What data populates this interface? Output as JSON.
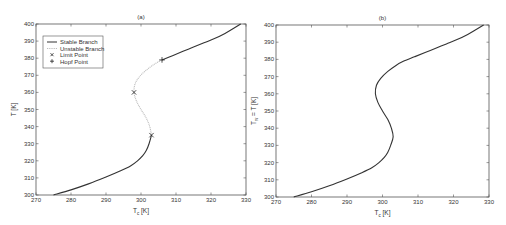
{
  "chart_data": [
    {
      "type": "line",
      "title": "(a)",
      "xlabel": "T_c [K]",
      "ylabel": "T [K]",
      "xlim": [
        270,
        330
      ],
      "ylim": [
        300,
        400
      ],
      "xticks": [
        270,
        280,
        290,
        300,
        310,
        320,
        330
      ],
      "yticks": [
        300,
        310,
        320,
        330,
        340,
        350,
        360,
        370,
        380,
        390,
        400
      ],
      "grid": false,
      "legend_position": "top-left",
      "legend": [
        "Stable Branch",
        "Unstable Branch",
        "Limit Point",
        "Hopf Point"
      ],
      "series": [
        {
          "name": "Stable Branch",
          "style": "solid",
          "color": "#333333",
          "segments": [
            {
              "x": [
                275,
                280,
                285,
                290,
                294,
                297,
                299,
                300.5,
                301.5,
                302.3,
                303
              ],
              "y": [
                300,
                303,
                306.5,
                310.5,
                314,
                317,
                320,
                323,
                326,
                330,
                335
              ]
            },
            {
              "x": [
                306,
                309,
                312,
                315,
                318,
                321,
                324,
                326.5,
                328.5
              ],
              "y": [
                379,
                381.5,
                384,
                386.5,
                389,
                391.5,
                394.5,
                397.5,
                400
              ]
            }
          ]
        },
        {
          "name": "Unstable Branch",
          "style": "dotted",
          "color": "#bbbbbb",
          "segments": [
            {
              "x": [
                303,
                302.5,
                301.5,
                300,
                298.7,
                298,
                298.3,
                299.5,
                301.5,
                303.8,
                306
              ],
              "y": [
                335,
                340,
                345,
                350,
                355,
                360,
                365,
                369,
                373,
                376.5,
                379
              ]
            }
          ]
        },
        {
          "name": "Limit Point",
          "marker": "x",
          "x": [
            298,
            303
          ],
          "y": [
            360,
            335
          ]
        },
        {
          "name": "Hopf Point",
          "marker": "+",
          "x": [
            306
          ],
          "y": [
            379
          ]
        }
      ]
    },
    {
      "type": "line",
      "title": "(b)",
      "xlabel": "T_c [K]",
      "ylabel": "T_w = T [K]",
      "xlim": [
        270,
        330
      ],
      "ylim": [
        300,
        400
      ],
      "xticks": [
        270,
        280,
        290,
        300,
        310,
        320,
        330
      ],
      "yticks": [
        300,
        310,
        320,
        330,
        340,
        350,
        360,
        370,
        380,
        390,
        400
      ],
      "grid": false,
      "series": [
        {
          "name": "curve",
          "style": "solid",
          "color": "#333333",
          "x": [
            275,
            280,
            285,
            290,
            294,
            297,
            299,
            300.5,
            301.5,
            302.3,
            303,
            302.5,
            301.5,
            300,
            298.7,
            298,
            298.3,
            299.5,
            301.5,
            303.8,
            306,
            309,
            312,
            315,
            318,
            321,
            324,
            326.5,
            328.5
          ],
          "y": [
            300,
            303,
            306.5,
            310.5,
            314,
            317,
            320,
            323,
            326,
            330,
            335,
            340,
            345,
            350,
            355,
            360,
            365,
            369,
            373,
            376.5,
            379,
            381.5,
            384,
            386.5,
            389,
            391.5,
            394.5,
            397.5,
            400
          ]
        }
      ]
    }
  ]
}
